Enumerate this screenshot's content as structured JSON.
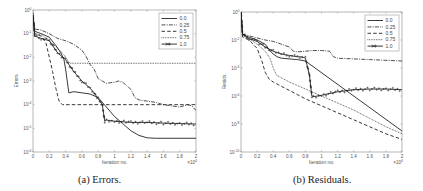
{
  "figure": {
    "subfigures": [
      {
        "caption": "(a)  Errors."
      },
      {
        "caption": "(b)  Residuals."
      }
    ]
  },
  "chart_data": [
    {
      "type": "line",
      "title": "",
      "caption": "(a) Errors.",
      "xlabel": "Iteration no.",
      "ylabel": "Errors",
      "x_multiplier": "×10^4",
      "xlim": [
        0,
        2
      ],
      "ylim_log10": [
        -6,
        0
      ],
      "yscale": "log",
      "grid": false,
      "legend_position": "upper right",
      "xticks": [
        "0",
        "0.2",
        "0.4",
        "0.6",
        "0.8",
        "1",
        "1.2",
        "1.4",
        "1.6",
        "1.8",
        "2"
      ],
      "yticks": [
        "10^0",
        "10^-1",
        "10^-2",
        "10^-3",
        "10^-4",
        "10^-5",
        "10^-6"
      ],
      "series": [
        {
          "name": "0.0",
          "style": "solid",
          "x": [
            0,
            0.02,
            0.1,
            0.2,
            0.28,
            0.34,
            0.38,
            0.4,
            0.42,
            0.44,
            0.5,
            0.6,
            0.7,
            0.8,
            0.9,
            1.0,
            1.1,
            1.2,
            1.3,
            1.4,
            1.5,
            2.0
          ],
          "log10_y": [
            -0.2,
            -0.9,
            -1.0,
            -1.15,
            -1.5,
            -1.8,
            -2.1,
            -2.5,
            -3.0,
            -3.5,
            -3.45,
            -3.5,
            -3.55,
            -3.7,
            -4.1,
            -4.5,
            -4.8,
            -5.1,
            -5.3,
            -5.4,
            -5.42,
            -5.42
          ]
        },
        {
          "name": "0.25",
          "style": "dashdot",
          "x": [
            0,
            0.02,
            0.1,
            0.2,
            0.3,
            0.4,
            0.5,
            0.6,
            0.65,
            0.7,
            0.75,
            0.8,
            0.9,
            1.0,
            1.05,
            1.1,
            1.2,
            1.25,
            1.3,
            1.4,
            1.5,
            1.6,
            1.7,
            1.8,
            1.9,
            1.95,
            2.0
          ],
          "log10_y": [
            -0.2,
            -0.8,
            -0.85,
            -1.0,
            -1.2,
            -1.3,
            -1.45,
            -1.7,
            -1.95,
            -2.3,
            -2.5,
            -2.9,
            -3.1,
            -3.05,
            -3.0,
            -3.05,
            -3.35,
            -3.7,
            -3.8,
            -3.85,
            -3.9,
            -4.0,
            -4.05,
            -4.1,
            -4.0,
            -4.05,
            -4.25
          ]
        },
        {
          "name": "0.5",
          "style": "dashed",
          "x": [
            0,
            0.02,
            0.1,
            0.16,
            0.2,
            0.24,
            0.28,
            0.32,
            0.36,
            2.0
          ],
          "log10_y": [
            -0.2,
            -1.0,
            -1.1,
            -1.4,
            -2.0,
            -2.6,
            -3.3,
            -3.85,
            -4.0,
            -4.0
          ]
        },
        {
          "name": "0.75",
          "style": "dotted",
          "x": [
            0,
            0.02,
            0.1,
            0.2,
            0.3,
            0.38,
            0.44,
            0.46,
            2.0
          ],
          "log10_y": [
            -0.2,
            -1.0,
            -1.05,
            -1.3,
            -1.6,
            -1.9,
            -2.2,
            -2.25,
            -2.25
          ]
        },
        {
          "name": "1.0",
          "style": "solid-plus",
          "x": [
            0,
            0.02,
            0.1,
            0.2,
            0.3,
            0.4,
            0.5,
            0.6,
            0.7,
            0.75,
            0.8,
            0.85,
            0.88,
            0.9,
            1.0,
            1.2,
            1.4,
            1.6,
            1.8,
            2.0
          ],
          "log10_y": [
            -0.2,
            -1.1,
            -1.2,
            -1.3,
            -1.8,
            -2.1,
            -2.6,
            -3.0,
            -3.3,
            -3.5,
            -3.75,
            -4.0,
            -4.7,
            -4.65,
            -4.7,
            -4.75,
            -4.75,
            -4.78,
            -4.8,
            -4.82
          ]
        }
      ]
    },
    {
      "type": "line",
      "title": "",
      "caption": "(b) Residuals.",
      "xlabel": "Iteration no.",
      "ylabel": "Resids",
      "x_multiplier": "×10^4",
      "xlim": [
        0,
        2
      ],
      "ylim_log10": [
        -10,
        0
      ],
      "yscale": "log",
      "grid": false,
      "legend_position": "upper right",
      "xticks": [
        "0",
        "0.2",
        "0.4",
        "0.6",
        "0.8",
        "1",
        "1.2",
        "1.4",
        "1.6",
        "1.8",
        "2"
      ],
      "yticks": [
        "10^0",
        "10^-2",
        "10^-4",
        "10^-6",
        "10^-8",
        "10^-10"
      ],
      "series": [
        {
          "name": "0.0",
          "style": "solid",
          "x": [
            0,
            0.02,
            0.1,
            0.2,
            0.3,
            0.35,
            0.4,
            0.45,
            0.5,
            0.6,
            0.7,
            0.8,
            2.0
          ],
          "log10_y": [
            0,
            -1.6,
            -1.8,
            -2.0,
            -2.3,
            -2.7,
            -3.0,
            -3.2,
            -3.3,
            -3.35,
            -3.4,
            -3.5,
            -8.5
          ]
        },
        {
          "name": "0.25",
          "style": "dashdot",
          "x": [
            0,
            0.02,
            0.1,
            0.2,
            0.3,
            0.4,
            0.5,
            0.6,
            0.65,
            0.7,
            0.8,
            0.9,
            1.0,
            1.1,
            1.15,
            1.2,
            1.4,
            1.6,
            1.8,
            2.0
          ],
          "log10_y": [
            0,
            -1.6,
            -1.7,
            -1.85,
            -2.0,
            -2.1,
            -2.3,
            -2.5,
            -2.8,
            -2.85,
            -2.8,
            -2.75,
            -2.75,
            -2.8,
            -3.2,
            -3.3,
            -3.35,
            -3.4,
            -3.45,
            -3.5
          ]
        },
        {
          "name": "0.5",
          "style": "dashed",
          "x": [
            0,
            0.02,
            0.1,
            0.2,
            0.26,
            0.3,
            0.35,
            0.4,
            0.6,
            0.8,
            1.0,
            1.2,
            1.4,
            1.6,
            1.8,
            2.0
          ],
          "log10_y": [
            0,
            -1.8,
            -2.0,
            -2.6,
            -3.5,
            -4.3,
            -4.8,
            -5.0,
            -5.6,
            -6.2,
            -6.7,
            -7.2,
            -7.7,
            -8.2,
            -8.7,
            -9.1
          ]
        },
        {
          "name": "0.75",
          "style": "dotted",
          "x": [
            0,
            0.02,
            0.1,
            0.2,
            0.3,
            0.36,
            0.4,
            0.44,
            0.5,
            0.6,
            0.8,
            1.0,
            1.2,
            1.4,
            1.6,
            1.8,
            2.0
          ],
          "log10_y": [
            0,
            -1.7,
            -1.9,
            -2.3,
            -2.8,
            -3.3,
            -4.0,
            -4.5,
            -4.7,
            -5.0,
            -5.5,
            -6.0,
            -6.5,
            -7.0,
            -7.6,
            -8.2,
            -8.7
          ]
        },
        {
          "name": "1.0",
          "style": "solid-plus",
          "x": [
            0,
            0.02,
            0.1,
            0.2,
            0.3,
            0.4,
            0.5,
            0.6,
            0.7,
            0.76,
            0.8,
            0.85,
            0.88,
            0.9,
            1.0,
            1.2,
            1.4,
            1.6,
            1.8,
            2.0
          ],
          "log10_y": [
            0,
            -1.6,
            -1.9,
            -2.1,
            -2.5,
            -2.8,
            -3.0,
            -3.1,
            -3.2,
            -3.2,
            -3.3,
            -4.5,
            -6.0,
            -6.05,
            -5.95,
            -5.7,
            -5.55,
            -5.5,
            -5.5,
            -5.55
          ]
        }
      ]
    }
  ]
}
